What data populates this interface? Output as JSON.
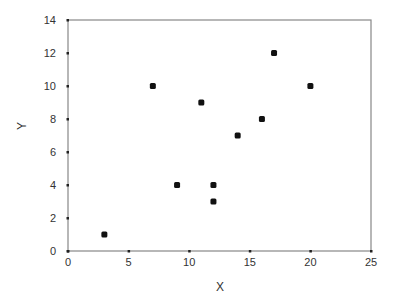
{
  "chart_data": {
    "type": "scatter",
    "title": "",
    "xlabel": "X",
    "ylabel": "Y",
    "xlim": [
      0,
      25
    ],
    "ylim": [
      0,
      14
    ],
    "xticks": [
      0,
      5,
      10,
      15,
      20,
      25
    ],
    "yticks": [
      0,
      2,
      4,
      6,
      8,
      10,
      12,
      14
    ],
    "grid": false,
    "legend": null,
    "series": [
      {
        "name": "points",
        "x": [
          3,
          7,
          9,
          11,
          12,
          12,
          14,
          16,
          17,
          20
        ],
        "y": [
          1,
          10,
          4,
          9,
          4,
          3,
          7,
          8,
          12,
          10
        ]
      }
    ],
    "colors": {
      "marker": "#111111",
      "axis": "#777777",
      "frame": "#888888",
      "text": "#333333"
    }
  },
  "layout": {
    "plot_left": 68,
    "plot_right": 371,
    "plot_top": 20,
    "plot_bottom": 251
  }
}
